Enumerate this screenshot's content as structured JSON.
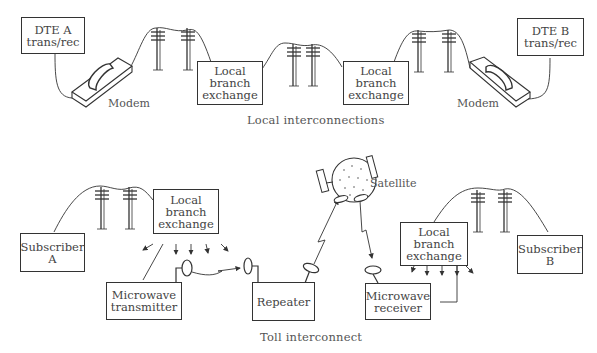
{
  "sections": {
    "local": {
      "caption": "Local interconnections",
      "dte_a": {
        "line1": "DTE A",
        "line2": "trans/rec"
      },
      "dte_b": {
        "line1": "DTE B",
        "line2": "trans/rec"
      },
      "modem_left": "Modem",
      "modem_right": "Modem",
      "lbe_left": {
        "line1": "Local",
        "line2": "branch",
        "line3": "exchange"
      },
      "lbe_right": {
        "line1": "Local",
        "line2": "branch",
        "line3": "exchange"
      }
    },
    "toll": {
      "caption": "Toll interconnect",
      "subscriber_a": {
        "line1": "Subscriber",
        "line2": "A"
      },
      "subscriber_b": {
        "line1": "Subscriber",
        "line2": "B"
      },
      "lbe_left": {
        "line1": "Local",
        "line2": "branch",
        "line3": "exchange"
      },
      "lbe_right": {
        "line1": "Local",
        "line2": "branch",
        "line3": "exchange"
      },
      "mw_transmitter": {
        "line1": "Microwave",
        "line2": "transmitter"
      },
      "repeater": "Repeater",
      "mw_receiver": {
        "line1": "Microwave",
        "line2": "receiver"
      },
      "satellite": "Satellite"
    }
  },
  "colors": {
    "line": "#333333",
    "text": "#444444",
    "background": "#ffffff"
  }
}
